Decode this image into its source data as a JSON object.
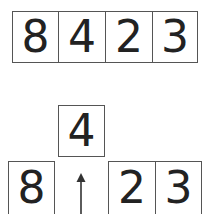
{
  "diagram": {
    "top_row": {
      "label": "original array",
      "digits": [
        "8",
        "4",
        "2",
        "3"
      ]
    },
    "bottom": {
      "lifted": "4",
      "left": [
        "8"
      ],
      "right": [
        "2",
        "3"
      ],
      "arrow": "up-arrow"
    },
    "colors": {
      "border": "#555555",
      "text": "#222222",
      "background": "#ffffff"
    }
  }
}
